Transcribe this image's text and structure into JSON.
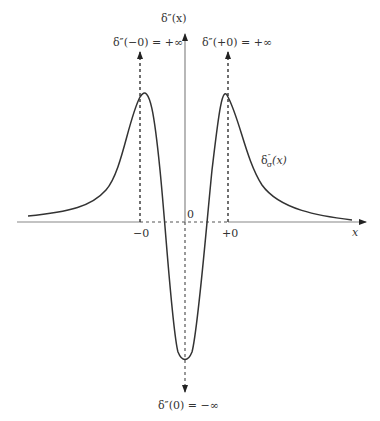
{
  "figure": {
    "y_axis_label": "δ″(x)",
    "x_axis_label": "x",
    "origin_label": "0",
    "left_tick_label": "−0",
    "right_tick_label": "+0",
    "left_peak_label": "δ″(−0) = +∞",
    "right_peak_label": "δ″(+0) = +∞",
    "bottom_label": "δ″(0) = −∞",
    "curve_label": "δ″σ(x)",
    "curve_label_base": "δ",
    "curve_label_sup": "″",
    "curve_label_sub": "σ",
    "curve_label_arg": "(x)",
    "line_color": "#333333"
  }
}
